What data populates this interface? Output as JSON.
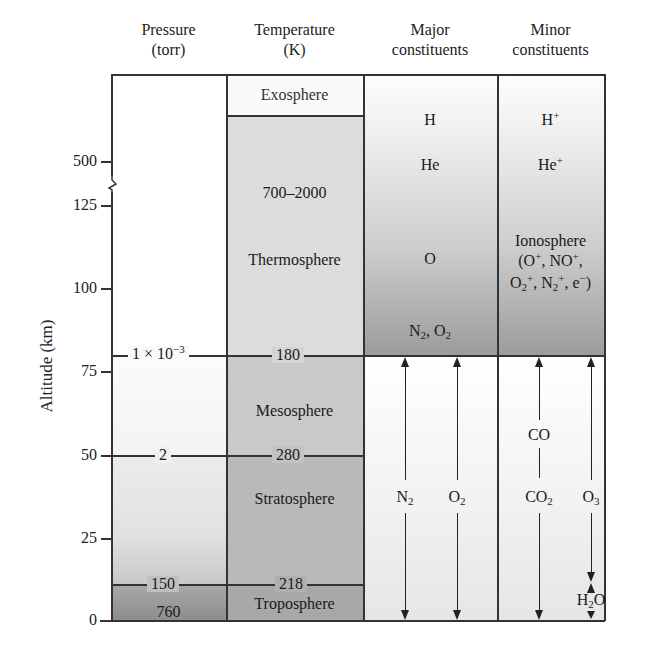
{
  "figure": {
    "columns": [
      {
        "line1": "Pressure",
        "line2": "(torr)"
      },
      {
        "line1": "Temperature",
        "line2": "(K)"
      },
      {
        "line1": "Major",
        "line2": "constituents"
      },
      {
        "line1": "Minor",
        "line2": "constituents"
      }
    ],
    "y_axis": {
      "label": "Altitude (km)",
      "ticks": [
        "500",
        "125",
        "100",
        "75",
        "50",
        "25",
        "0"
      ],
      "axis_break": "between 500 and 125"
    },
    "pressure": {
      "boundary_1": "1 × 10",
      "boundary_1_exp": "−3",
      "boundary_2": "2",
      "boundary_3": "150",
      "surface": "760"
    },
    "temperature": {
      "exosphere": "Exosphere",
      "thermo_range": "700–2000",
      "thermosphere": "Thermosphere",
      "t_180": "180",
      "mesosphere": "Mesosphere",
      "t_280": "280",
      "stratosphere": "Stratosphere",
      "t_218": "218",
      "troposphere": "Troposphere"
    },
    "major": {
      "h": "H",
      "he": "He",
      "o": "O",
      "n2o2_n": "N",
      "n2o2_sub1": "2",
      "n2o2_mid": ", O",
      "n2o2_sub2": "2",
      "n2_base": "N",
      "n2_sub": "2",
      "o2_base": "O",
      "o2_sub": "2"
    },
    "minor": {
      "hplus_base": "H",
      "hplus_sup": "+",
      "heplus_base": "He",
      "heplus_sup": "+",
      "ionosphere": "Ionosphere",
      "ions_line1_a": "(O",
      "ions_line1_sup1": "+",
      "ions_line1_b": ", NO",
      "ions_line1_sup2": "+",
      "ions_line1_c": ",",
      "ions_line2_a": "O",
      "ions_line2_sub1": "2",
      "ions_line2_sup1": "+",
      "ions_line2_b": ", N",
      "ions_line2_sub2": "2",
      "ions_line2_sup2": "+",
      "ions_line2_c": ", e",
      "ions_line2_sup3": "−",
      "ions_line2_d": ")",
      "co": "CO",
      "co2_base": "CO",
      "co2_sub": "2",
      "o3_base": "O",
      "o3_sub": "3",
      "h2o_a": "H",
      "h2o_sub": "2",
      "h2o_b": "O"
    }
  }
}
